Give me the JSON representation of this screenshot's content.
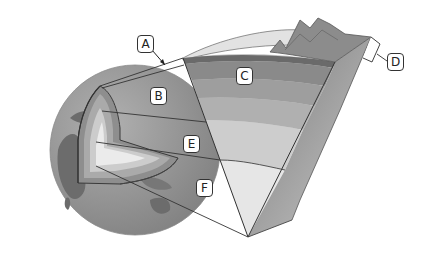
{
  "diagram": {
    "labels": [
      {
        "id": "A",
        "text": "A",
        "target": "thin outer layer (crust)"
      },
      {
        "id": "B",
        "text": "B",
        "target": "globe cutaway outer region"
      },
      {
        "id": "C",
        "text": "C",
        "target": "upper mantle band in wedge"
      },
      {
        "id": "D",
        "text": "D",
        "target": "bracketed surface layer thickness"
      },
      {
        "id": "E",
        "text": "E",
        "target": "outer core region"
      },
      {
        "id": "F",
        "text": "F",
        "target": "inner core region"
      }
    ],
    "colors": {
      "ocean": "#8a8a8a",
      "land": "#6e6e6e",
      "crust": "#7d7d7d",
      "mantle_outer": "#9a9a9a",
      "mantle_inner": "#b5b5b5",
      "outer_core": "#cfcfcf",
      "inner_core": "#e8e8e8",
      "atmosphere": "#e3e3e3",
      "outline": "#333333"
    }
  }
}
